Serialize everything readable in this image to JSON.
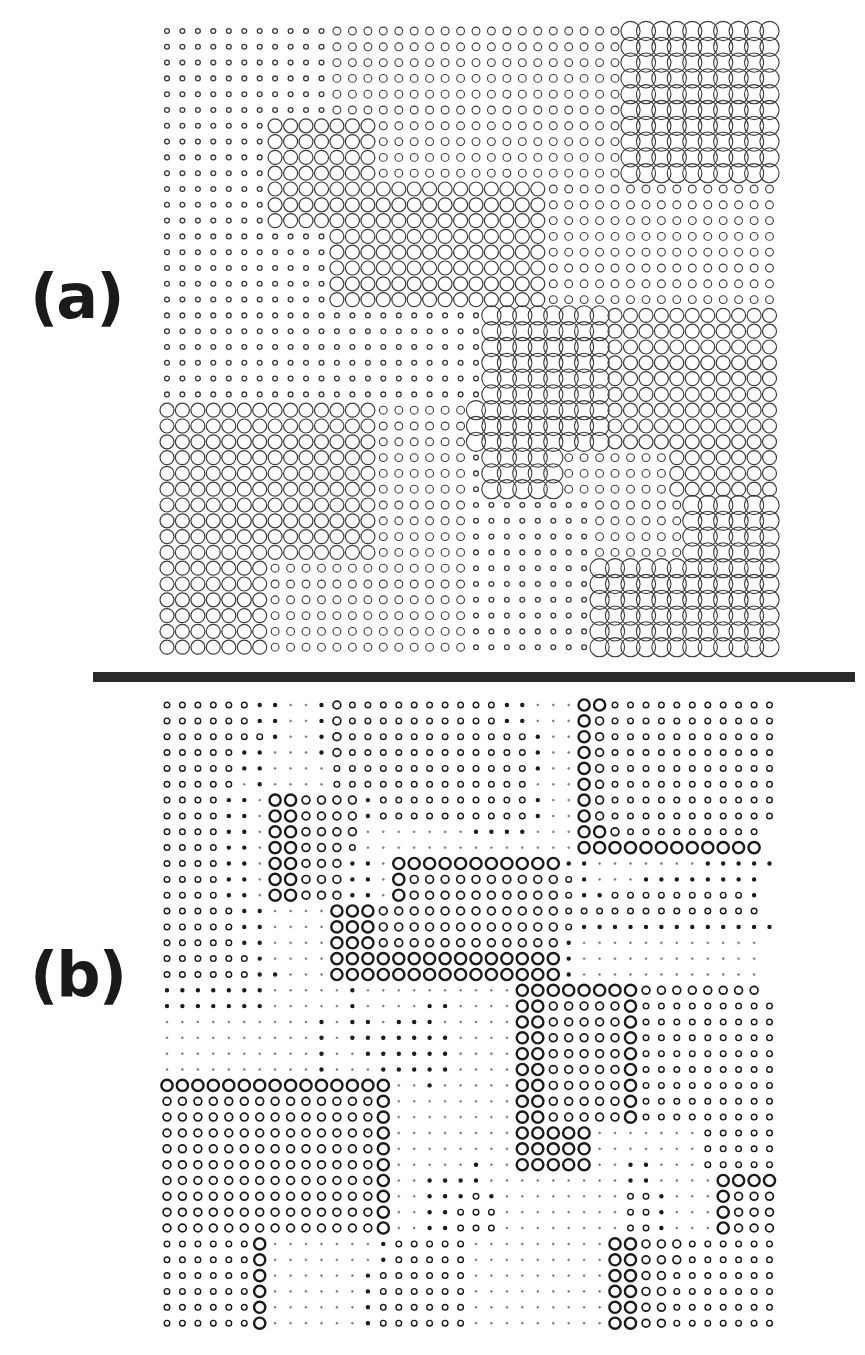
{
  "figure": {
    "panel_a": {
      "label": "(a)",
      "grid": {
        "cols": 40,
        "rows": 40,
        "x0": 167,
        "dx": 15.45,
        "y0": 31,
        "dy": 15.8
      },
      "legend_size_classes": {
        "t": "tiny",
        "s": "small",
        "m": "medium",
        "L": "large"
      },
      "cells": [
        "tttttttttttsssssssssssssssssssLLLLLLLLLL",
        "tttttttttttsssssssssssssssssssLLLLLLLLLL",
        "tttttttttttsssssssssssssssssssLLLLLLLLLL",
        "tttttttttttsssssssssssssssssssLLLLLLLLLL",
        "tttttttttttsssssssssssssssssssLLLLLLLLLL",
        "tttttttttttsssssssssssssssssssLLLLLLLLLL",
        "tttttttmmmmmmmssssssssssssssssLLLLLLLLLL",
        "tttttttmmmmmmmssssssssssssssssLLLLLLLLLL",
        "tttttttmmmmmmmssssssssssssssssLLLLLLLLLL",
        "tttttttmmmmmmmssssssssssssssssLLLLLLLLLL",
        "tttttttmmmmmmmmmmmmmmmmmmsssssssssssssss",
        "tttttttmmmmmmmmmmmmmmmmmmsssssssssssssss",
        "tttttttmmmmmmmmmmmmmmmmmmsssssssssssssss",
        "tttttttttttmmmmmmmmmmmmmmsssssssssssssss",
        "tttttttttttmmmmmmmmmmmmmmsssssssssssssss",
        "tttttttttttmmmmmmmmmmmmmmsssssssssssssss",
        "tttttttttttmmmmmmmmmmmmmmsssssssssssssss",
        "tttttttttttmmmmmmmmmmmmmmsssssssssssssss",
        "tttttttttttttttttttttLLLLLLLLmmmmmmmmmmm",
        "tttttttttttttttttttttLLLLLLLLmmmmmmmmmmm",
        "tttttttttttttttttttttLLLLLLLLmmmmmmmmmmm",
        "tttttttttttttttttttttLLLLLLLLmmmmmmmmmmm",
        "tttttttttttttttttttttLLLLLLLLmmmmmmmmmmm",
        "tttttttttttttttttttttLLLLLLLLmmmmmmmmmmm",
        "mmmmmmmmmmmmmmssssssLLLLLLLLLmmmmmmmmmmm",
        "mmmmmmmmmmmmmmssssssLLLLLLLLLmmmmmmmmmmm",
        "mmmmmmmmmmmmmmssssssLLLLLLLLLmmmmmmmmmmm",
        "mmmmmmmmmmmmmmsssssstLLLLLsssssssmmmmmmm",
        "mmmmmmmmmmmmmmsssssstLLLLLsssssssmmmmmmm",
        "mmmmmmmmmmmmmmsssssstLLLLLsssssssmmmmmmm",
        "mmmmmmmmmmmmmmssssssttttttttssssssLLLLLL",
        "mmmmmmmmmmmmmmssssssttttttttssssssLLLLLL",
        "mmmmmmmmmmmmmmssssssttttttttssssssLLLLLL",
        "mmmmmmmmmmmmmmssssssttttttttssssssLLLLLL",
        "mmmmmmmsssssssssssssttttttttLLLLLLLLLLLL",
        "mmmmmmmsssssssssssssttttttttLLLLLLLLLLLL",
        "mmmmmmmsssssssssssssttttttttLLLLLLLLLLLL",
        "mmmmmmmsssssssssssssttttttttLLLLLLLLLLLL",
        "mmmmmmmsssssssssssssttttttttLLLLLLLLLLLL",
        "mmmmmmmsssssssssssssttttttttLLLLLLLLLLLL"
      ]
    },
    "panel_b": {
      "label": "(b)",
      "grid": {
        "cols": 40,
        "rows": 40,
        "x0": 167,
        "dx": 15.45,
        "y0": 705,
        "dy": 15.85
      },
      "legend_size_classes": {
        ".": "dot",
        "t": "tiny",
        "s": "small",
        "m": "medium",
        "B": "bold-large"
      },
      "cells": [
        "sssssstt..tmsssssssssstt...BBsssssssssss",
        "sssssstt..tmsssssssssstt...Bmsssssssssss",
        "ssssssst..tmsssssssssssst..Bmsssssssssss",
        "ssssstt...tmsssssssssssst..Bmsssssssssss",
        "ssssstt....ssssssssssssst..Bmsssssssssss",
        "sssss.t....sssssssssssss...Bmsssssssssss",
        "sssstt.BBmmmmtsssssssssst..Bmsssssssssss",
        "sssstt.BBmmmmtsssssssssst..Bmsssssssssss",
        "sssstt.BBmmmm.......tttt...BBmsssssssss",
        "sssstt.BBmmms..............BBBBBBBBBBBB",
        "sssstt.BBmmmtt.BBBBBBBBBBBtt.......ttttt",
        "sssstt.BBmmmtt.Bmmmmmmmmmmst...tttttttt",
        "sssstt.BBmmmtt.Bmmmmmmmmmmsttssssssssst",
        "ssssstt....BBBmmmmmmmmmmmmsssssssssssss",
        "ssssstt....BBBmmmmmmmmmmmmsttttttttttttt",
        "ssssstt....BBBmmmmmmmmmmmmt............",
        "sssssst....BBBBBBBBBBBBBBBt............",
        "sssssstt...BBBBBBBBBBBBBBBt............",
        "ttttttt.....t..........BBBBBBBBmmmmmmmm",
        "ttttttt.....t....tt....BBmmmmmBsssssssss",
        "..........t.tt.ttt.....BBmmmmmBsssssssss",
        "..........t.ttttttt....BBmmmmmBsssssssss",
        "..........t..tttttt....BBmmmmmBsssssssss",
        "..........t...ttttt....BBmmmmmBsssssssss",
        "BBBBBBBBBBBBBBB..t.....BBmmmmmBsssssssss",
        "mmmmmmmmmmmmmmB........BBmmmmmBsssssssss",
        "mmmmmmmmmmmmmmB........BBmmmmmBsssssssss",
        "mmmmmmmmmmmmmmB........BBBBB.......sssss",
        "mmmmmmmmmmmmmmB........BBBBB.......sssss",
        "mmmmmmmmmmmmmmB.....t..BBBBB..tt...sssss",
        "mmmmmmmmmmmmmmB..tttt.........tt....BBBBBB",
        "mmmmmmmmmmmmmmB..tttst........sst...Bmmmmm",
        "mmmmmmmmmmmmmmB..ttsss........sst...Bmmmmm",
        "mmmmmmmmmmmmmmB..ttsss........sst...Bmmmmm",
        "ssssssB.......tsssss.........BBmmmsssssss",
        "ssssssB.......tsssss.........BBmmmsssssss",
        "ssssssB......tssssss.........BBmmsssssss",
        "ssssssB......tssssss.........BBmmsssssss",
        "ssssssB......tssssss.........BBmmsssssss",
        "ssssssB......tssssss.........BBmmsssssss"
      ]
    },
    "divider": {
      "color": "#2a2a2a"
    },
    "colors": {
      "stroke": "#3a3a3a",
      "bold_stroke": "#1a1a1a",
      "label": "#1a1a1a",
      "background": "#ffffff"
    }
  }
}
